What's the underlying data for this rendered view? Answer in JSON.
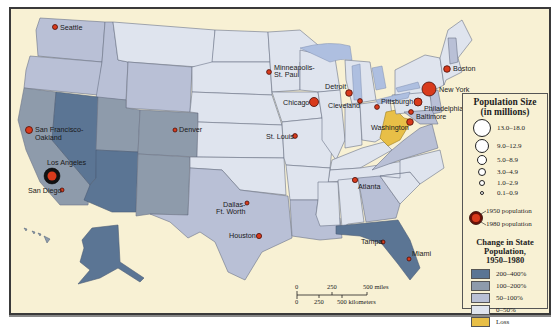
{
  "map": {
    "background_color": "#f8f1d4",
    "state_colors": {
      "200-400": "#5b7594",
      "100-200": "#8e9bab",
      "50-100": "#b9c0d6",
      "0-50": "#dfe4ee",
      "loss": "#e8bf47"
    },
    "cities": [
      {
        "name": "Seattle",
        "label": "Seattle"
      },
      {
        "name": "San Francisco-Oakland",
        "label_line1": "San Francisco-",
        "label_line2": "Oakland"
      },
      {
        "name": "Los Angeles",
        "label": "Los Angeles"
      },
      {
        "name": "San Diego",
        "label": "San Diego"
      },
      {
        "name": "Denver",
        "label": "Denver"
      },
      {
        "name": "Minneapolis-St. Paul",
        "label_line1": "Minneapolis-",
        "label_line2": "St. Paul"
      },
      {
        "name": "Chicago",
        "label": "Chicago"
      },
      {
        "name": "St. Louis",
        "label": "St. Louis"
      },
      {
        "name": "Detroit",
        "label": "Detroit"
      },
      {
        "name": "Cleveland",
        "label": "Cleveland"
      },
      {
        "name": "Pittsburgh",
        "label": "Pittsburgh"
      },
      {
        "name": "Boston",
        "label": "Boston"
      },
      {
        "name": "New York",
        "label": "New York"
      },
      {
        "name": "Philadelphia",
        "label": "Philadelphia"
      },
      {
        "name": "Baltimore",
        "label": "Baltimore"
      },
      {
        "name": "Washington",
        "label": "Washington"
      },
      {
        "name": "Atlanta",
        "label": "Atlanta"
      },
      {
        "name": "Dallas-Ft. Worth",
        "label_line1": "Dallas-",
        "label_line2": "Ft. Worth"
      },
      {
        "name": "Houston",
        "label": "Houston"
      },
      {
        "name": "Tampa",
        "label": "Tampa"
      },
      {
        "name": "Miami",
        "label": "Miami"
      }
    ]
  },
  "legend": {
    "population_title_line1": "Population Size",
    "population_title_line2": "(in millions)",
    "size_classes": [
      "13.0–18.0",
      "9.0–12.9",
      "5.0–8.9",
      "3.0–4.9",
      "1.0–2.9",
      "0.1–0.9"
    ],
    "pop_1950_label": "1950 population",
    "pop_1980_label": "1980 population",
    "change_title_line1": "Change in State",
    "change_title_line2": "Population,",
    "change_title_line3": "1950–1980",
    "change_classes": [
      {
        "label": "200–400%",
        "color": "#5b7594"
      },
      {
        "label": "100–200%",
        "color": "#8e9bab"
      },
      {
        "label": "50–100%",
        "color": "#b9c0d6"
      },
      {
        "label": "0–50%",
        "color": "#dfe4ee"
      },
      {
        "label": "Loss",
        "color": "#e8bf47"
      }
    ]
  },
  "scale": {
    "miles_ticks": [
      "0",
      "250",
      "500 miles"
    ],
    "km_ticks": [
      "0",
      "250",
      "500 kilometers"
    ]
  }
}
